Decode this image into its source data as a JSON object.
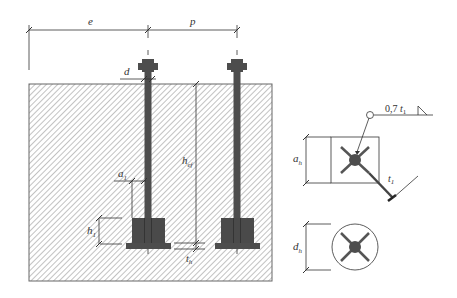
{
  "diagram": {
    "colors": {
      "steel": "#4d4d4d",
      "steel_dark": "#3a3a3a",
      "line": "#333333",
      "hatch": "#b0b0b0",
      "background": "#ffffff"
    },
    "dimensions": {
      "edge_distance": {
        "symbol": "e"
      },
      "spacing": {
        "symbol": "p"
      },
      "bolt_diameter": {
        "symbol": "d"
      },
      "offset": {
        "symbol": "a",
        "subscript": "1"
      },
      "plate_height": {
        "symbol": "h",
        "subscript": "1"
      },
      "embedment_depth": {
        "symbol": "h",
        "subscript": "ef"
      },
      "plate_thickness": {
        "symbol": "t",
        "subscript": "h"
      },
      "square_plate_size": {
        "symbol": "a",
        "subscript": "h"
      },
      "round_plate_diameter": {
        "symbol": "d",
        "subscript": "h"
      },
      "weld_thickness": {
        "symbol": "t",
        "subscript": "1"
      }
    },
    "weld_annotation": {
      "prefix": "0,7",
      "symbol": "t",
      "subscript": "1"
    },
    "details": [
      {
        "name": "square-anchor-plate",
        "shape": "square"
      },
      {
        "name": "circular-anchor-plate",
        "shape": "circle"
      }
    ]
  }
}
